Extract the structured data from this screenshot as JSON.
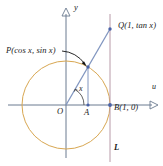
{
  "figure": {
    "colors": {
      "circle": "#d8a752",
      "ray": "#8196c0",
      "axis": "#6b7a90",
      "vertical_line": "#b89aa8",
      "point": "#4a63a8",
      "text": "#1a1a1a",
      "background": "#ffffff"
    },
    "labels": {
      "point_p": "P(cos x, sin x)",
      "point_q": "Q(1, tan x)",
      "point_b": "B(1, 0)",
      "origin": "O",
      "point_a": "A",
      "angle": "x",
      "y_axis": "y",
      "u_axis": "u",
      "line_l": "L"
    },
    "geometry": {
      "origin_px": [
        66,
        105
      ],
      "radius_px": 44,
      "point_a_px": [
        88,
        105
      ],
      "point_b_px": [
        110,
        105
      ],
      "point_p_px": [
        88,
        67
      ],
      "point_q_px": [
        110,
        29
      ],
      "angle_degrees": 60
    }
  }
}
